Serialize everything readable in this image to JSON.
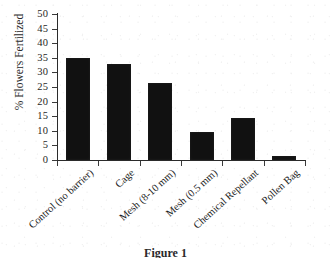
{
  "chart_data": {
    "type": "bar",
    "title": "",
    "xlabel": "",
    "ylabel": "% Flowers Fertilized",
    "ylim": [
      0,
      50
    ],
    "yticks": [
      0,
      5,
      10,
      15,
      20,
      25,
      30,
      35,
      40,
      45,
      50
    ],
    "ytick_labels": [
      "0",
      "5",
      "10",
      "15",
      "20",
      "25",
      "30",
      "35",
      "40",
      "45",
      "50"
    ],
    "grid": false,
    "legend": false,
    "bar_color": "#111111",
    "categories": [
      "Control (no barrier)",
      "Cage",
      "Mesh (8-10 mm)",
      "Mesh (0.5 mm)",
      "Chemical Repellant",
      "Pollen Bag"
    ],
    "values": [
      35.0,
      33.0,
      26.5,
      9.5,
      14.5,
      1.3
    ]
  },
  "caption": {
    "text": "Figure 1"
  }
}
